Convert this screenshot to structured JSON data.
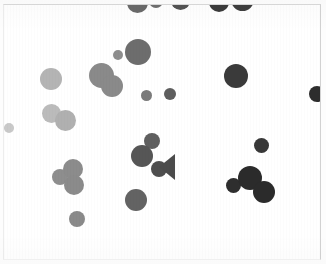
{
  "canvas": {
    "width": 326,
    "height": 264,
    "background_color": "#ffffff",
    "frame": {
      "x": 3,
      "y": 4,
      "width": 318,
      "height": 256,
      "border_color": "#d9d9d9"
    }
  },
  "chart_data": {
    "type": "scatter",
    "title": "",
    "subtitle": "",
    "xlabel": "",
    "ylabel": "",
    "xlim": [
      0,
      326
    ],
    "ylim": [
      0,
      264
    ],
    "grid": false,
    "legend": null,
    "annotations": [],
    "tick_labels": {
      "x": [],
      "y": []
    },
    "marker": "filled-circle",
    "value_encoding": "grayscale intensity; radius = blob size in pixels",
    "point_count": 33,
    "palette": {
      "lightest": "#c9c9c9",
      "light": "#bdbdbd",
      "mid_light": "#a8a8a8",
      "mid": "#8f8f8f",
      "mid_dark": "#777777",
      "dark": "#5a5a5a",
      "darker": "#484848",
      "darkest": "#2c2c2c"
    },
    "points": [
      {
        "id": "p01",
        "label": "top-clipped-1",
        "cx": 136,
        "cy": 1,
        "r": 10.5,
        "color": "#6a6a6a",
        "clipped": "top"
      },
      {
        "id": "p02",
        "label": "top-clipped-2",
        "cx": 155,
        "cy": 0,
        "r": 7.0,
        "color": "#6e6e6e",
        "clipped": "top"
      },
      {
        "id": "p03",
        "label": "top-clipped-3",
        "cx": 179,
        "cy": -1,
        "r": 9.5,
        "color": "#545454",
        "clipped": "top"
      },
      {
        "id": "p04",
        "label": "top-clipped-4",
        "cx": 218,
        "cy": 1,
        "r": 10.0,
        "color": "#3b3b3b",
        "clipped": "top"
      },
      {
        "id": "p05",
        "label": "top-clipped-5",
        "cx": 241,
        "cy": -2,
        "r": 11.5,
        "color": "#3f3f3f",
        "clipped": "top"
      },
      {
        "id": "p06",
        "label": "upper-mid-small",
        "cx": 117,
        "cy": 54,
        "r": 5.0,
        "color": "#8e8e8e",
        "clipped": null
      },
      {
        "id": "p07",
        "label": "upper-mid-large",
        "cx": 137,
        "cy": 51,
        "r": 13.0,
        "color": "#6d6d6d",
        "clipped": null
      },
      {
        "id": "p08",
        "label": "left-light-large",
        "cx": 50,
        "cy": 78,
        "r": 11.0,
        "color": "#b4b4b4",
        "clipped": null
      },
      {
        "id": "p09",
        "label": "center-blob-a",
        "cx": 100,
        "cy": 74,
        "r": 12.5,
        "color": "#8a8a8a",
        "clipped": null
      },
      {
        "id": "p10",
        "label": "center-blob-b",
        "cx": 111,
        "cy": 85,
        "r": 11.0,
        "color": "#8a8a8a",
        "clipped": null
      },
      {
        "id": "p11",
        "label": "mid-dot-a",
        "cx": 145,
        "cy": 94,
        "r": 5.5,
        "color": "#7b7b7b",
        "clipped": null
      },
      {
        "id": "p12",
        "label": "mid-dot-b",
        "cx": 169,
        "cy": 93,
        "r": 6.0,
        "color": "#5e5e5e",
        "clipped": null
      },
      {
        "id": "p13",
        "label": "right-dark-large",
        "cx": 235,
        "cy": 75,
        "r": 12.0,
        "color": "#3a3a3a",
        "clipped": null
      },
      {
        "id": "p14",
        "label": "right-edge-clipped",
        "cx": 316,
        "cy": 93,
        "r": 8.0,
        "color": "#2d2d2d",
        "clipped": "right"
      },
      {
        "id": "p15",
        "label": "left-pair-a",
        "cx": 50,
        "cy": 112,
        "r": 9.5,
        "color": "#bbbbbb",
        "clipped": null
      },
      {
        "id": "p16",
        "label": "left-pair-b",
        "cx": 64,
        "cy": 119,
        "r": 10.5,
        "color": "#b0b0b0",
        "clipped": null
      },
      {
        "id": "p17",
        "label": "far-left-tiny",
        "cx": 8,
        "cy": 127,
        "r": 5.0,
        "color": "#c9c9c9",
        "clipped": null
      },
      {
        "id": "p18",
        "label": "center-top-dot",
        "cx": 151,
        "cy": 140,
        "r": 8.0,
        "color": "#5f5f5f",
        "clipped": null
      },
      {
        "id": "p19",
        "label": "center-cluster-big",
        "cx": 141,
        "cy": 155,
        "r": 11.0,
        "color": "#565656",
        "clipped": null
      },
      {
        "id": "p20",
        "label": "center-cluster-sm",
        "cx": 158,
        "cy": 168,
        "r": 8.0,
        "color": "#4e4e4e",
        "clipped": null
      },
      {
        "id": "p21",
        "label": "right-mid-dot",
        "cx": 260,
        "cy": 144,
        "r": 7.5,
        "color": "#383838",
        "clipped": null
      },
      {
        "id": "p22",
        "label": "bottomleft-small",
        "cx": 59,
        "cy": 176,
        "r": 8.0,
        "color": "#8e8e8e",
        "clipped": null
      },
      {
        "id": "p23",
        "label": "bottomleft-mid",
        "cx": 72,
        "cy": 168,
        "r": 10.0,
        "color": "#8c8c8c",
        "clipped": null
      },
      {
        "id": "p24",
        "label": "bottomleft-low",
        "cx": 73,
        "cy": 184,
        "r": 10.0,
        "color": "#8b8b8b",
        "clipped": null
      },
      {
        "id": "p25",
        "label": "bottom-center-dot",
        "cx": 135,
        "cy": 199,
        "r": 11.0,
        "color": "#636363",
        "clipped": null
      },
      {
        "id": "p26",
        "label": "bottom-left-dot",
        "cx": 76,
        "cy": 218,
        "r": 8.0,
        "color": "#8a8a8a",
        "clipped": null
      },
      {
        "id": "p27",
        "label": "right-cluster-sm",
        "cx": 232,
        "cy": 184,
        "r": 7.5,
        "color": "#2e2e2e",
        "clipped": null
      },
      {
        "id": "p28",
        "label": "right-cluster-big",
        "cx": 249,
        "cy": 177,
        "r": 12.0,
        "color": "#2b2b2b",
        "clipped": null
      },
      {
        "id": "p29",
        "label": "right-cluster-low",
        "cx": 263,
        "cy": 191,
        "r": 11.0,
        "color": "#2b2b2b",
        "clipped": null
      }
    ],
    "wedges": [
      {
        "id": "w01",
        "label": "center-wedge",
        "cx": 166,
        "cy": 166,
        "width": 16,
        "height": 26,
        "color": "#4b4b4b",
        "orientation": "apex-left"
      }
    ]
  },
  "figure": {
    "name": "grayscale-particle-scatter"
  }
}
